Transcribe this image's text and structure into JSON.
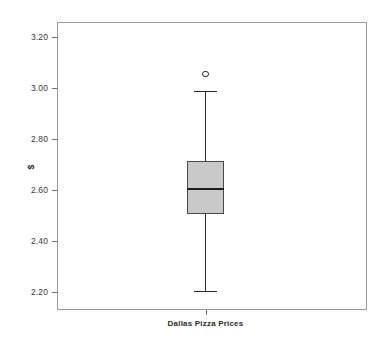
{
  "chart_data": {
    "type": "box",
    "title": "",
    "xlabel": "Dallas Pizza Prices",
    "ylabel": "$",
    "grid": false,
    "legend": "none",
    "ylim": [
      2.13,
      3.26
    ],
    "yticks": [
      "3.20",
      "3.00",
      "2.80",
      "2.60",
      "2.40",
      "2.20"
    ],
    "ytick_values": [
      3.2,
      3.0,
      2.8,
      2.6,
      2.4,
      2.2
    ],
    "categories": [
      "Dallas Pizza Prices"
    ],
    "series": [
      {
        "name": "Dallas Pizza Prices",
        "whisker_low": 2.205,
        "q1": 2.505,
        "median": 2.605,
        "q3": 2.715,
        "whisker_high": 2.99,
        "outliers": [
          3.055
        ]
      }
    ]
  },
  "axes": {
    "y_title": "$",
    "x_label": "Dallas Pizza Prices",
    "tick_labels": [
      "3.20",
      "3.00",
      "2.80",
      "2.60",
      "2.40",
      "2.20"
    ]
  },
  "colors": {
    "box_fill": "#c9c9c9",
    "box_stroke": "#4a4a4a",
    "median": "#1d1d1d",
    "whisker": "#2a2a2a",
    "frame": "#9a9a9a",
    "background": "#ffffff",
    "text": "#2b2b2b"
  }
}
